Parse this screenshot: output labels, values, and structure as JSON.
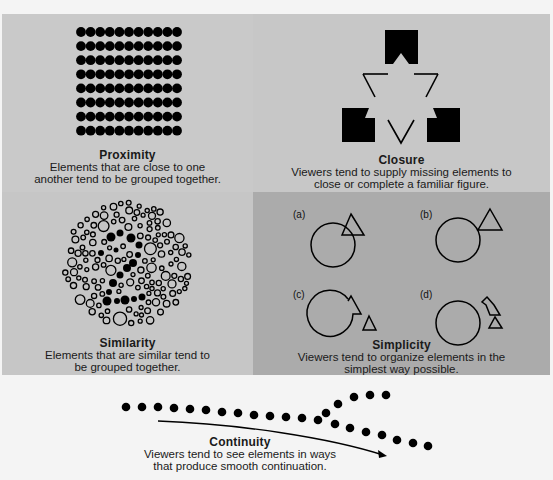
{
  "colors": {
    "background": "#f4f4f4",
    "proximity_panel": "#c9c9c9",
    "closure_panel": "#c7c7c7",
    "similarity_panel": "#c6c6c6",
    "simplicity_panel": "#ababab",
    "ink": "#000000"
  },
  "proximity": {
    "title": "Proximity",
    "line1": "Elements that are close to one",
    "line2": "another tend to be grouped together.",
    "grid": {
      "columns": 11,
      "rows": 8
    }
  },
  "closure": {
    "title": "Closure",
    "line1": "Viewers tend to supply missing elements to",
    "line2": "close or complete a familiar figure."
  },
  "similarity": {
    "title": "Similarity",
    "line1": "Elements that are similar tend to",
    "line2": "be grouped together.",
    "hidden_figure": "2"
  },
  "simplicity": {
    "title": "Simplicity",
    "line1": "Viewers tend to organize elements in the",
    "line2": "simplest way possible.",
    "labels": {
      "a": "(a)",
      "b": "(b)",
      "c": "(c)",
      "d": "(d)"
    }
  },
  "continuity": {
    "title": "Continuity",
    "line1": "Viewers tend to see elements in ways",
    "line2": "that produce smooth continuation."
  }
}
